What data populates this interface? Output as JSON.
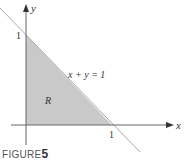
{
  "figure": {
    "caption_label": "FIGURE",
    "caption_number": "5",
    "x_axis_label": "x",
    "y_axis_label": "y",
    "x_tick": "1",
    "y_tick": "1",
    "line_label": "x + y = 1",
    "region_label": "R",
    "colors": {
      "region_fill": "#c9c9c9",
      "line": "#a0a0a0",
      "axis": "#555555"
    }
  }
}
